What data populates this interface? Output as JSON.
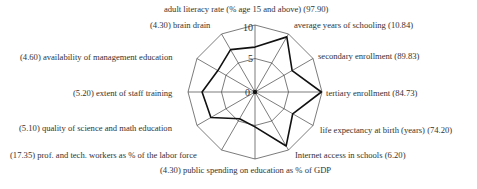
{
  "chart_data": {
    "type": "radar",
    "title": "",
    "center": [
      255,
      92
    ],
    "radius": 67,
    "rmax": 10,
    "rings": [
      5,
      10
    ],
    "tick_labels": [
      "0",
      "5",
      "10"
    ],
    "grid": true,
    "axes": [
      {
        "label": "adult literacy rate (% age 15 and above) (97.90)",
        "name": "adult literacy rate (% age 15 and above)",
        "raw": "97.90",
        "value": 6.7
      },
      {
        "label": "average years of schooling (10.84)",
        "name": "average years of schooling",
        "raw": "10.84",
        "value": 9.5
      },
      {
        "label": "secondary enrollment (89.83)",
        "name": "secondary enrollment",
        "raw": "89.83",
        "value": 6.4
      },
      {
        "label": "tertiary enrollment (84.73)",
        "name": "tertiary enrollment",
        "raw": "84.73",
        "value": 9.9
      },
      {
        "label": "life expectancy at birth (years) (74.20)",
        "name": "life expectancy at birth (years)",
        "raw": "74.20",
        "value": 6.5
      },
      {
        "label": "Internet access in schools (6.20)",
        "name": "Internet access in schools",
        "raw": "6.20",
        "value": 9.3
      },
      {
        "label": "(4.30) public spending on education as % of GDP",
        "name": "public spending on education as % of GDP",
        "raw": "4.30",
        "value": 5.2
      },
      {
        "label": "(17.35) prof. and tech. workers as % of the labor force",
        "name": "prof. and tech. workers as % of the labor force",
        "raw": "17.35",
        "value": 4.6
      },
      {
        "label": "(5.10) quality of science and math education",
        "name": "quality of science and math education",
        "raw": "5.10",
        "value": 7.6
      },
      {
        "label": "(5.20) extent of staff training",
        "name": "extent of staff training",
        "raw": "5.20",
        "value": 7.9
      },
      {
        "label": "(4.60) availability of management education",
        "name": "availability of management education",
        "raw": "4.60",
        "value": 6.4
      },
      {
        "label": "(4.30) brain drain",
        "name": "brain drain",
        "raw": "4.30",
        "value": 7.3
      }
    ],
    "colors": {
      "grid": "#444444",
      "series": "#111111",
      "text": "#333333"
    }
  },
  "labels": {
    "l0": "adult literacy rate (% age 15 and above) (97.90)",
    "l1": "average years of schooling (10.84)",
    "l2": "secondary enrollment (89.83)",
    "l3": "tertiary enrollment (84.73)",
    "l4": "life expectancy at birth (years) (74.20)",
    "l5": "Internet access in schools (6.20)",
    "l6": "(4.30) public spending on education as % of GDP",
    "l7": "(17.35) prof. and tech. workers as % of the labor force",
    "l8": "(5.10) quality of science and math education",
    "l9": "(5.20) extent of staff training",
    "l10": "(4.60) availability of management education",
    "l11": "(4.30) brain drain"
  },
  "ticks": {
    "t0": "0",
    "t5": "5",
    "t10": "10"
  }
}
